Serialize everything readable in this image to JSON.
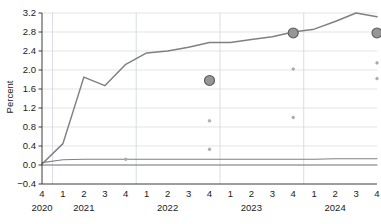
{
  "chart_data": {
    "type": "line",
    "title": "",
    "xlabel": "",
    "ylabel": "Percent",
    "ylim": [
      -0.4,
      3.2
    ],
    "yticks": [
      "3.2",
      "2.8",
      "2.4",
      "2.0",
      "1.6",
      "1.2",
      "0.8",
      "0.4",
      "0.0",
      "−0.4"
    ],
    "ytick_values": [
      3.2,
      2.8,
      2.4,
      2.0,
      1.6,
      1.2,
      0.8,
      0.4,
      0.0,
      -0.4
    ],
    "grid": "horizontal-and-year-separators",
    "legend": "none",
    "x": [
      "2020Q4",
      "2021Q1",
      "2021Q2",
      "2021Q3",
      "2021Q4",
      "2022Q1",
      "2022Q2",
      "2022Q3",
      "2022Q4",
      "2023Q1",
      "2023Q2",
      "2023Q3",
      "2023Q4",
      "2024Q1",
      "2024Q2",
      "2024Q3",
      "2024Q4"
    ],
    "xtick_labels": [
      "4",
      "1",
      "2",
      "3",
      "4",
      "1",
      "2",
      "3",
      "4",
      "1",
      "2",
      "3",
      "4",
      "1",
      "2",
      "3",
      "4"
    ],
    "year_labels": [
      {
        "label": "2020",
        "at_index": 0
      },
      {
        "label": "2021",
        "at_index": 2
      },
      {
        "label": "2022",
        "at_index": 6
      },
      {
        "label": "2023",
        "at_index": 10
      },
      {
        "label": "2024",
        "at_index": 14
      }
    ],
    "year_boundaries": [
      0.5,
      4.5,
      8.5,
      12.5
    ],
    "series": [
      {
        "name": "main-line",
        "kind": "line",
        "color": "#808080",
        "values": [
          0.02,
          0.45,
          1.85,
          1.67,
          2.12,
          2.36,
          2.4,
          2.48,
          2.58,
          2.58,
          2.64,
          2.7,
          2.8,
          2.86,
          3.02,
          3.2,
          3.12
        ]
      },
      {
        "name": "flat-line-upper",
        "kind": "line",
        "color": "#808080",
        "values": [
          0.05,
          0.11,
          0.12,
          0.12,
          0.12,
          0.12,
          0.12,
          0.12,
          0.12,
          0.12,
          0.12,
          0.12,
          0.12,
          0.12,
          0.13,
          0.13,
          0.13
        ]
      },
      {
        "name": "flat-line-zero",
        "kind": "line",
        "color": "#7a7a7a",
        "values": [
          0.0,
          0.0,
          0.0,
          0.0,
          0.0,
          0.0,
          0.0,
          0.0,
          0.0,
          0.0,
          0.0,
          0.0,
          0.0,
          0.0,
          0.0,
          0.0,
          0.0
        ]
      }
    ],
    "markers_large": [
      {
        "x_index": 8,
        "x_label": "2022Q4",
        "y": 1.78,
        "color": "#969696",
        "edge": "#5a5a5a",
        "r": 5.0
      },
      {
        "x_index": 12,
        "x_label": "2023Q4",
        "y": 2.78,
        "color": "#969696",
        "edge": "#5a5a5a",
        "r": 5.0
      },
      {
        "x_index": 16,
        "x_label": "2024Q4",
        "y": 2.78,
        "color": "#969696",
        "edge": "#5a5a5a",
        "r": 5.0
      }
    ],
    "markers_small": [
      {
        "x_index": 4,
        "x_label": "2021Q4",
        "y": 0.12,
        "color": "#b0b0b0",
        "r": 1.4
      },
      {
        "x_index": 8,
        "x_label": "2022Q4",
        "y": 0.93,
        "color": "#b0b0b0",
        "r": 1.4
      },
      {
        "x_index": 8,
        "x_label": "2022Q4",
        "y": 0.33,
        "color": "#b0b0b0",
        "r": 1.4
      },
      {
        "x_index": 12,
        "x_label": "2023Q4",
        "y": 2.02,
        "color": "#b0b0b0",
        "r": 1.4
      },
      {
        "x_index": 12,
        "x_label": "2023Q4",
        "y": 1.0,
        "color": "#b0b0b0",
        "r": 1.4
      },
      {
        "x_index": 16,
        "x_label": "2024Q4",
        "y": 2.15,
        "color": "#b0b0b0",
        "r": 1.4
      },
      {
        "x_index": 16,
        "x_label": "2024Q4",
        "y": 1.82,
        "color": "#b0b0b0",
        "r": 1.4
      }
    ],
    "colors": {
      "line": "#808080",
      "marker_fill": "#969696",
      "marker_edge": "#5a5a5a",
      "small_marker": "#b0b0b0",
      "grid": "#d8d8d8",
      "axis": "#3c3c3c",
      "background": "#ffffff",
      "text": "#1a1a1a"
    }
  }
}
